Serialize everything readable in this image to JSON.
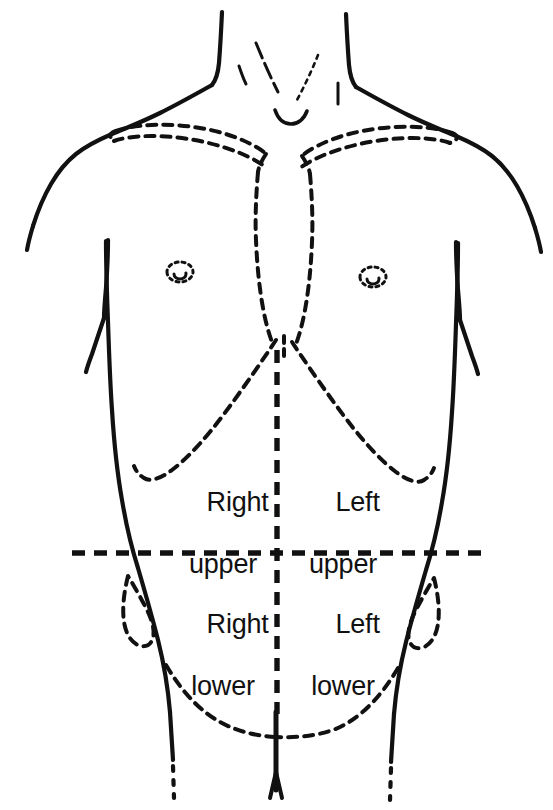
{
  "figure": {
    "type": "anatomical-diagram",
    "background_color": "#ffffff",
    "ink_color": "#111111"
  },
  "quadrants": [
    {
      "id": "right-upper",
      "line1": "Right",
      "line2": "upper",
      "position": "upper-left-of-image"
    },
    {
      "id": "left-upper",
      "line1": "Left",
      "line2": "upper",
      "position": "upper-right-of-image"
    },
    {
      "id": "right-lower",
      "line1": "Right",
      "line2": "lower",
      "position": "lower-left-of-image"
    },
    {
      "id": "left-lower",
      "line1": "Left",
      "line2": "lower",
      "position": "lower-right-of-image"
    }
  ],
  "landmarks": [
    {
      "id": "clavicle-left",
      "style": "dashed"
    },
    {
      "id": "clavicle-right",
      "style": "dashed"
    },
    {
      "id": "sternum",
      "style": "dashed"
    },
    {
      "id": "costal-margin",
      "style": "dashed"
    },
    {
      "id": "nipple-left",
      "style": "dashed"
    },
    {
      "id": "nipple-right",
      "style": "dashed"
    },
    {
      "id": "iliac-crest-left",
      "style": "dashed"
    },
    {
      "id": "iliac-crest-right",
      "style": "dashed"
    },
    {
      "id": "inguinal-ligament",
      "style": "dashed"
    },
    {
      "id": "vertical-midline",
      "style": "dashed-heavy"
    },
    {
      "id": "transumbilical-line",
      "style": "dashed-heavy"
    }
  ],
  "strokes": {
    "body_outline_width": 4,
    "landmark_dash": "9 7",
    "divider_dash": "13 9",
    "divider_width": 5
  }
}
